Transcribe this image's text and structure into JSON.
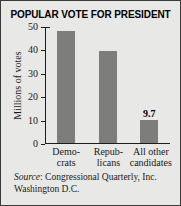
{
  "chart_data": {
    "type": "bar",
    "title": "POPULAR VOTE FOR PRESIDENT",
    "xlabel": "",
    "ylabel": "Millions of votes",
    "categories": [
      "Demo-crats",
      "Repub-licans",
      "All other candidates"
    ],
    "category_lines": [
      {
        "line1": "Demo-",
        "line2": "crats"
      },
      {
        "line1": "Repub-",
        "line2": "licans"
      },
      {
        "line1": "All other",
        "line2": "candidates"
      }
    ],
    "values": [
      48.0,
      39.5,
      9.7
    ],
    "value_labels": [
      "",
      "",
      "9.7"
    ],
    "ylim": [
      0,
      50
    ],
    "yticks": [
      0,
      10,
      20,
      30,
      40,
      50
    ],
    "ytick_labels": [
      "0",
      "10",
      "20",
      "30",
      "40",
      "50"
    ],
    "grid": false,
    "legend": "none",
    "bar_color": "#7d7d7b",
    "axis_color": "#1d1d1b",
    "background_color": "#e8e8e6"
  },
  "source": {
    "label": "Source",
    "separator": ":",
    "line1": " Congressional Quarterly, Inc.",
    "line2": "Washington D.C."
  }
}
